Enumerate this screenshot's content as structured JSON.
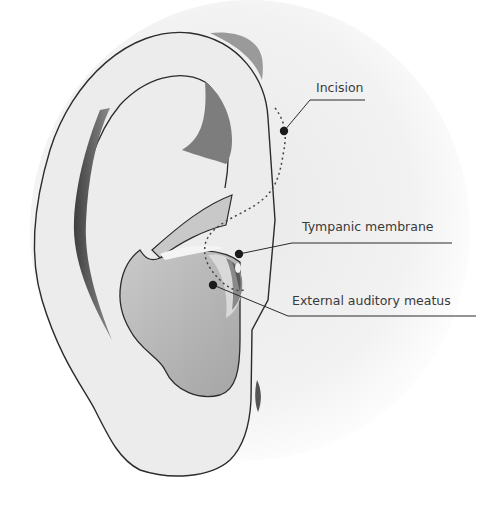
{
  "diagram": {
    "colors": {
      "background": "#ffffff",
      "skin": "#ececec",
      "outline": "#2b2b2b",
      "shadow_dark": "#555555",
      "shadow_mid": "#8a8a8a",
      "concha": "#b9b9b9",
      "leader_line": "#2b2b2b",
      "marker": "#1a1a1a",
      "label_text": "#3a3a3a"
    },
    "labels": [
      {
        "id": "incision",
        "text": "Incision"
      },
      {
        "id": "tympanic-membrane",
        "text": "Tympanic membrane"
      },
      {
        "id": "external-auditory-meatus",
        "text": "External auditory meatus"
      }
    ]
  }
}
